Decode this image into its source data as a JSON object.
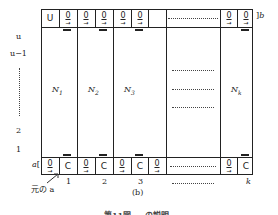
{
  "figure": {
    "panel_label": "(b)",
    "caption_partial": "第11図 … の説明",
    "top_row": {
      "label_right": "b",
      "cells": [
        "U",
        "0",
        "0",
        "0",
        "0",
        "0",
        "……………",
        "0",
        "0"
      ]
    },
    "bottom_row": {
      "label_left": "a",
      "cells": [
        "0",
        "C",
        "0",
        "C",
        "0",
        "C",
        "0",
        "……………",
        "0",
        "C"
      ]
    },
    "columns": [
      {
        "name": "N1",
        "sym": "N",
        "sub": "1"
      },
      {
        "name": "N2",
        "sym": "N",
        "sub": "2"
      },
      {
        "name": "N3",
        "sym": "N",
        "sub": "3"
      },
      {
        "name": "Nk",
        "sym": "N",
        "sub": "k"
      }
    ],
    "column_indices": [
      "1",
      "2",
      "3",
      "……………",
      "k"
    ],
    "row_labels": [
      "u",
      "u−1",
      "⋮",
      "2",
      "1"
    ],
    "origin_annotation": "元の a"
  }
}
